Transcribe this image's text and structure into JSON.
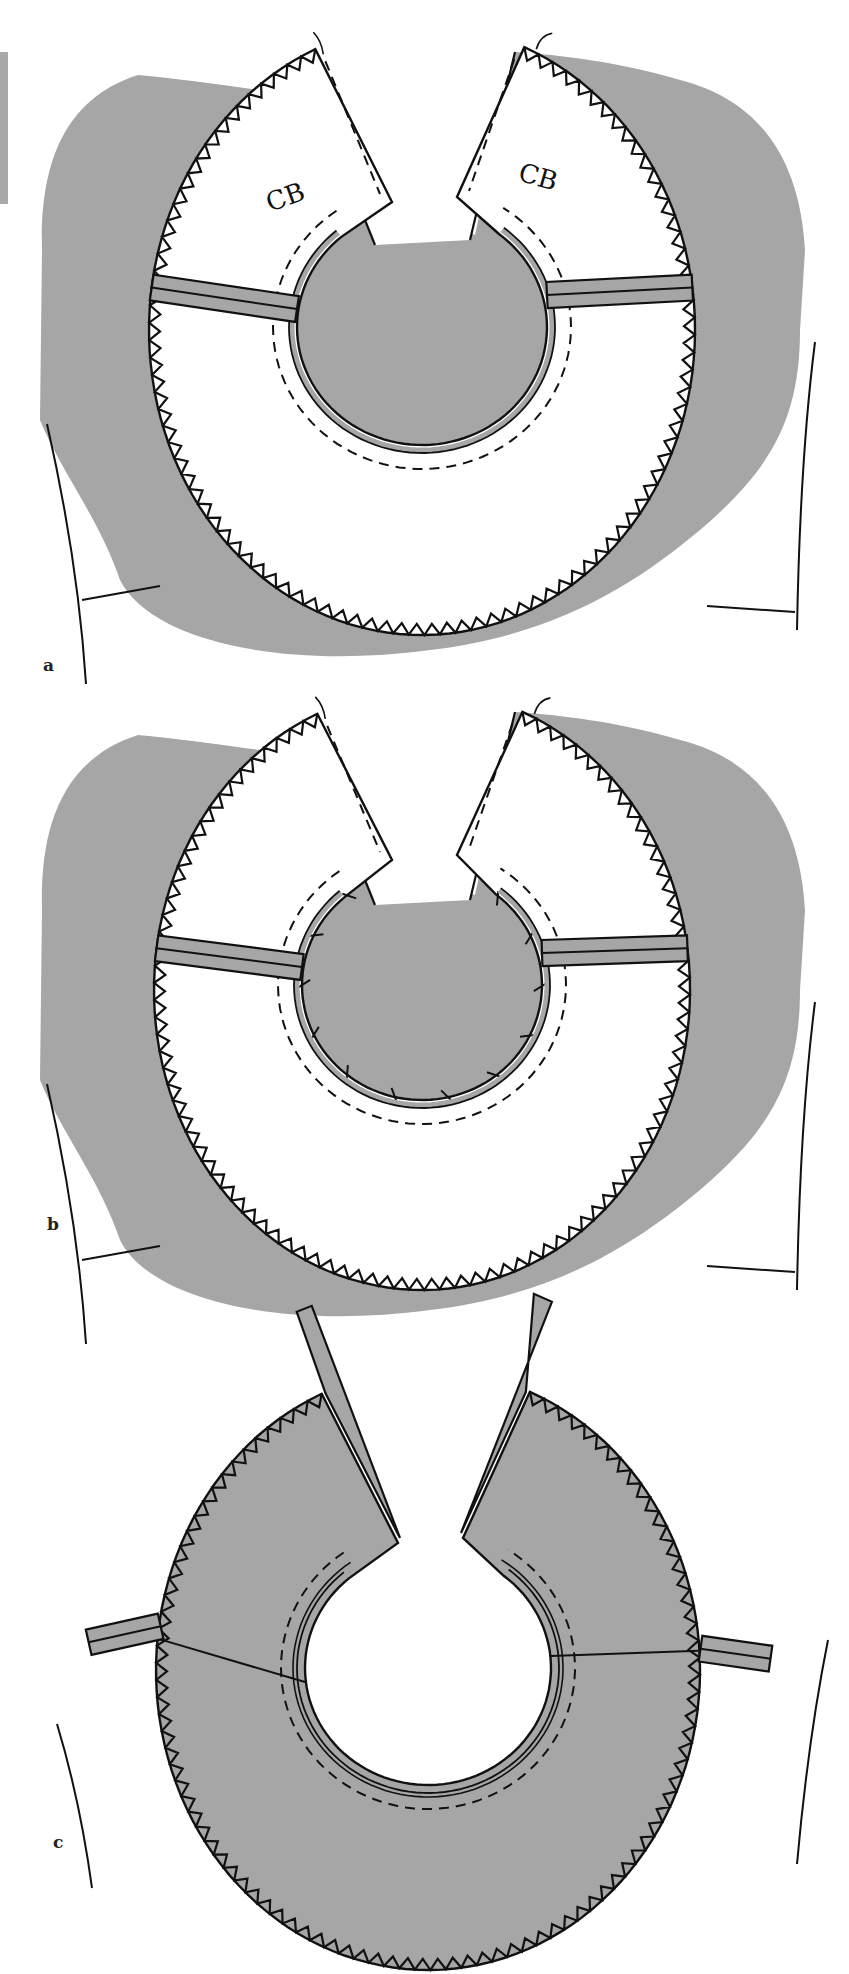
{
  "figure": {
    "colors": {
      "fabric_gray": "#a6a6a6",
      "line": "#111111",
      "paper": "#ffffff"
    },
    "panels": [
      {
        "id": "a",
        "label": "a",
        "annotations": [
          "CB",
          "CB"
        ],
        "collar_fill": "#ffffff",
        "garment_fill": "#a6a6a6",
        "center": [
          422,
          330
        ],
        "outer_radius": [
          273,
          305
        ],
        "inner_radius": [
          125,
          118
        ],
        "inner_center": [
          422,
          327
        ],
        "has_clipped_seam": false,
        "has_cb_labels": true
      },
      {
        "id": "b",
        "label": "b",
        "annotations": [],
        "collar_fill": "#ffffff",
        "garment_fill": "#a6a6a6",
        "center": [
          422,
          990
        ],
        "outer_radius": [
          268,
          300
        ],
        "inner_radius": [
          120,
          115
        ],
        "inner_center": [
          422,
          985
        ],
        "has_clipped_seam": true,
        "has_cb_labels": false
      },
      {
        "id": "c",
        "label": "c",
        "annotations": [],
        "collar_fill": "#a6a6a6",
        "garment_fill": "none",
        "center": [
          428,
          1670
        ],
        "outer_radius": [
          272,
          300
        ],
        "inner_radius": [
          123,
          117
        ],
        "inner_center": [
          428,
          1668
        ],
        "has_clipped_seam": false,
        "has_cb_labels": false
      }
    ]
  }
}
